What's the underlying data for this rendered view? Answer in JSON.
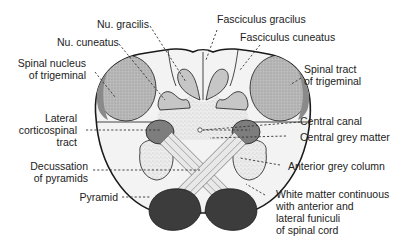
{
  "diagram": {
    "colors": {
      "background": "#ffffff",
      "outline": "#1a1a1a",
      "white_matter": "#f2f2f2",
      "grey_matter_stipple": "#e4e4e4",
      "nuclei_grey": "#c4c4c4",
      "trigeminal_nucleus": "#b5b5b5",
      "trigeminal_tract": "#8a8a8a",
      "corticospinal": "#7a7a7a",
      "pyramid": "#3c3c3c",
      "decussation_fibres": "#d8d8d8",
      "label_text": "#222222"
    }
  },
  "labels": {
    "nu_gracilis": "Nu. gracilis",
    "fasciculus_gracilus": "Fasciculus gracilus",
    "nu_cuneatus": "Nu. cuneatus",
    "fasciculus_cuneatus": "Fasciculus cuneatus",
    "spinal_nucleus_trigeminal_1": "Spinal nucleus",
    "spinal_nucleus_trigeminal_2": "of trigeminal",
    "spinal_tract_trigeminal_1": "Spinal tract",
    "spinal_tract_trigeminal_2": "of trigeminal",
    "lateral_corticospinal_1": "Lateral",
    "lateral_corticospinal_2": "corticospinal",
    "lateral_corticospinal_3": "tract",
    "central_canal": "Central canal",
    "central_grey_matter": "Central grey matter",
    "decussation_1": "Decussation",
    "decussation_2": "of pyramids",
    "anterior_grey_column": "Anterior grey column",
    "pyramid": "Pyramid",
    "white_matter_1": "White matter continuous",
    "white_matter_2": "with anterior and",
    "white_matter_3": "lateral funiculi",
    "white_matter_4": "of spinal cord"
  }
}
